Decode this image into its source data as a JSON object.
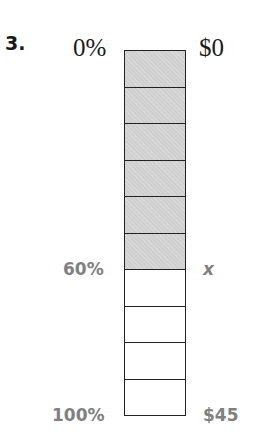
{
  "problem": {
    "number": "3."
  },
  "bar_model": {
    "segments_total": 10,
    "segments_shaded": 6,
    "shade_color": "#d0d0d0",
    "left_labels": {
      "top": "0%",
      "middle": "60%",
      "bottom": "100%"
    },
    "right_labels": {
      "top": "$0",
      "middle": "x",
      "bottom": "$45"
    }
  },
  "colors": {
    "text_dark": "#1a1a1a",
    "text_gray": "#808080",
    "outline": "#222222"
  }
}
